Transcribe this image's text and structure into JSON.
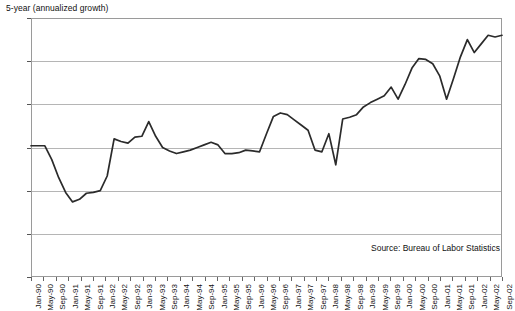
{
  "chart_data": {
    "type": "line",
    "title": "5-year (annualized growth)",
    "xlabel": "",
    "ylabel": "",
    "ylim": [
      0.0,
      3.0
    ],
    "ytick_values": [
      0.0,
      0.5,
      1.0,
      1.5,
      2.0,
      2.5,
      3.0
    ],
    "ytick_labels": [
      "0.0",
      "0.5",
      "1.0",
      "1.5",
      "2.0",
      "2.5",
      "3.0"
    ],
    "grid": true,
    "legend": "none",
    "annotations": [
      "Source: Bureau of Labor Statistics"
    ],
    "source_note": "Source: Bureau of Labor Statistics",
    "line_color": "#2b2b2b",
    "grid_color": "#b5b5b5",
    "axis_color": "#9a9a9a",
    "categories": [
      "Jan-90",
      "May-90",
      "Sep-90",
      "Jan-91",
      "May-91",
      "Sep-91",
      "Jan-92",
      "May-92",
      "Sep-92",
      "Jan-93",
      "May-93",
      "Sep-93",
      "Jan-94",
      "May-94",
      "Sep-94",
      "Jan-95",
      "May-95",
      "Sep-95",
      "Jan-96",
      "May-96",
      "Sep-96",
      "Jan-97",
      "May-97",
      "Sep-97",
      "Jan-98",
      "May-98",
      "Sep-98",
      "Jan-99",
      "May-99",
      "Sep-99",
      "Jan-00",
      "May-00",
      "Sep-00",
      "Jan-01",
      "May-01",
      "Sep-01",
      "Jan-02",
      "May-02",
      "Sep-02"
    ],
    "xtick_labels": [
      "Jan-90",
      "May-90",
      "Sep-90",
      "Jan-91",
      "May-91",
      "Sep-91",
      "Jan-92",
      "May-92",
      "Sep-92",
      "Jan-93",
      "May-93",
      "Sep-93",
      "Jan-94",
      "May-94",
      "Sep-94",
      "Jan-95",
      "May-95",
      "Sep-95",
      "Jan-96",
      "May-96",
      "Sep-96",
      "Jan-97",
      "May-97",
      "Sep-97",
      "Jan-98",
      "May-98",
      "Sep-98",
      "Jan-99",
      "May-99",
      "Sep-99",
      "Jan-00",
      "May-00",
      "Sep-00",
      "Jan-01",
      "May-01",
      "Sep-01",
      "Jan-02",
      "May-02",
      "Sep-02"
    ],
    "values": [
      1.52,
      1.52,
      1.28,
      1.0,
      0.87,
      0.97,
      0.98,
      1.08,
      1.6,
      1.55,
      1.63,
      1.8,
      1.58,
      1.5,
      1.43,
      1.47,
      1.53,
      1.55,
      1.52,
      1.42,
      1.44,
      1.45,
      1.72,
      1.9,
      1.85,
      1.78,
      1.45,
      1.62,
      1.3,
      1.85,
      1.88,
      2.02,
      2.1,
      2.22,
      2.18,
      2.38,
      2.32,
      2.55,
      2.53
    ],
    "series": [
      {
        "name": "5-year (annualized growth)",
        "values": [
          1.52,
          1.52,
          1.28,
          1.0,
          0.87,
          0.97,
          0.98,
          1.08,
          1.6,
          1.55,
          1.63,
          1.8,
          1.58,
          1.5,
          1.43,
          1.47,
          1.53,
          1.55,
          1.52,
          1.42,
          1.44,
          1.45,
          1.72,
          1.9,
          1.85,
          1.78,
          1.45,
          1.62,
          1.3,
          1.85,
          1.88,
          2.02,
          2.1,
          2.22,
          2.18,
          2.38,
          2.32,
          2.55,
          2.53
        ]
      }
    ],
    "detail_points": [
      1.52,
      1.52,
      1.52,
      1.36,
      1.15,
      0.98,
      0.87,
      0.9,
      0.97,
      0.98,
      1.0,
      1.17,
      1.6,
      1.57,
      1.55,
      1.62,
      1.63,
      1.8,
      1.63,
      1.5,
      1.46,
      1.43,
      1.45,
      1.47,
      1.5,
      1.53,
      1.56,
      1.53,
      1.43,
      1.43,
      1.44,
      1.47,
      1.46,
      1.45,
      1.66,
      1.86,
      1.9,
      1.88,
      1.82,
      1.76,
      1.7,
      1.47,
      1.45,
      1.66,
      1.3,
      1.83,
      1.85,
      1.88,
      1.97,
      2.02,
      2.06,
      2.1,
      2.2,
      2.06,
      2.23,
      2.42,
      2.53,
      2.52,
      2.47,
      2.33,
      2.06,
      2.3,
      2.55,
      2.75,
      2.6,
      2.7,
      2.8,
      2.78,
      2.8
    ]
  }
}
